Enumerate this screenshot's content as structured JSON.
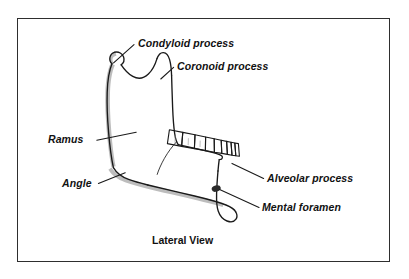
{
  "figure": {
    "caption": "Lateral View",
    "background_color": "#ffffff",
    "frame_color": "#2e2e2e",
    "line_color": "#1a1a1a",
    "shading_color": "#b8b8b8",
    "label_color": "#111111"
  },
  "labels": [
    {
      "id": "condyloid",
      "text": "Condyloid process"
    },
    {
      "id": "coronoid",
      "text": "Coronoid process"
    },
    {
      "id": "ramus",
      "text": "Ramus"
    },
    {
      "id": "angle",
      "text": "Angle"
    },
    {
      "id": "alveolar",
      "text": "Alveolar process"
    },
    {
      "id": "mental",
      "text": "Mental foramen"
    }
  ],
  "anatomy": {
    "structure": "mandible",
    "view": "lateral",
    "parts": [
      "condyle",
      "sigmoid notch",
      "coronoid process",
      "ramus",
      "angle",
      "body",
      "alveolar process",
      "teeth",
      "mental foramen"
    ],
    "tooth_count": 9
  }
}
